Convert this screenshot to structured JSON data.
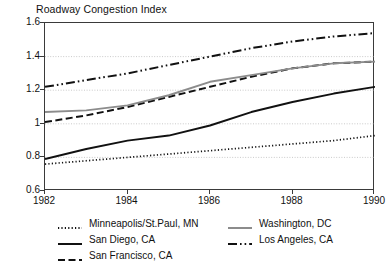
{
  "chart_data": {
    "type": "line",
    "title": "Roadway Congestion Index",
    "xlabel": "",
    "ylabel": "",
    "xlim": [
      1982,
      1990
    ],
    "ylim": [
      0.6,
      1.6
    ],
    "ytick_labels": [
      "1.6",
      "1.4",
      "1.2",
      "1",
      "0.8",
      "0.6"
    ],
    "ytick_values": [
      1.6,
      1.4,
      1.2,
      1.0,
      0.8,
      0.6
    ],
    "xtick_labels": [
      "1982",
      "1984",
      "1986",
      "1988",
      "1990"
    ],
    "xtick_values": [
      1982,
      1984,
      1986,
      1988,
      1990
    ],
    "grid": "horizontal-dotted",
    "legend_position": "bottom",
    "x": [
      1982,
      1983,
      1984,
      1985,
      1986,
      1987,
      1988,
      1989,
      1990
    ],
    "series": [
      {
        "name": "Minneapolis/St.Paul, MN",
        "style": "dotted",
        "color": "#111111",
        "values": [
          0.76,
          0.78,
          0.8,
          0.82,
          0.84,
          0.86,
          0.88,
          0.9,
          0.93
        ]
      },
      {
        "name": "San Diego, CA",
        "style": "solid",
        "color": "#111111",
        "values": [
          0.79,
          0.85,
          0.9,
          0.93,
          0.99,
          1.07,
          1.13,
          1.18,
          1.22
        ]
      },
      {
        "name": "San Francisco, CA",
        "style": "dashed",
        "color": "#111111",
        "values": [
          1.01,
          1.05,
          1.1,
          1.16,
          1.22,
          1.28,
          1.33,
          1.36,
          1.37
        ]
      },
      {
        "name": "Washington, DC",
        "style": "solid",
        "color": "#8c8c8c",
        "values": [
          1.07,
          1.08,
          1.11,
          1.17,
          1.25,
          1.29,
          1.33,
          1.36,
          1.37
        ]
      },
      {
        "name": "Los Angeles, CA",
        "style": "dash-dot-dot",
        "color": "#111111",
        "values": [
          1.22,
          1.26,
          1.3,
          1.35,
          1.4,
          1.45,
          1.49,
          1.52,
          1.54
        ]
      }
    ]
  }
}
